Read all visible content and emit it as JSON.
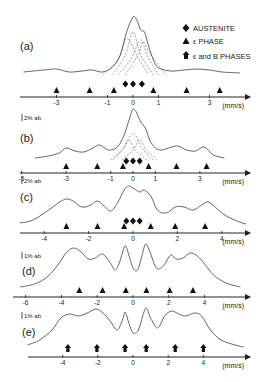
{
  "figure": {
    "legend": {
      "austenite": "AUSTENITE",
      "epsilon": "ε PHASE",
      "epsilon_b": "ε and B PHASES"
    },
    "unit": "(mm/s)"
  },
  "chart_data": [
    {
      "type": "line",
      "panel": "(a)",
      "title": "(a)",
      "xlabel": "(mm/s)",
      "scale_label": "",
      "xticks": [
        -3,
        -1,
        0,
        1,
        3
      ],
      "x0_px": 133,
      "px_per_unit": 25.5,
      "axis_y": 97,
      "axis_x_range": [
        20,
        250
      ],
      "curve": [
        [
          -4.3,
          72
        ],
        [
          -3.5,
          70
        ],
        [
          -3,
          69
        ],
        [
          -2.5,
          72
        ],
        [
          -2,
          71
        ],
        [
          -1.6,
          70
        ],
        [
          -1.2,
          72
        ],
        [
          -0.8,
          67
        ],
        [
          -0.5,
          55
        ],
        [
          -0.25,
          32
        ],
        [
          0,
          17
        ],
        [
          0.15,
          20
        ],
        [
          0.3,
          30
        ],
        [
          0.45,
          32
        ],
        [
          0.6,
          45
        ],
        [
          0.8,
          60
        ],
        [
          1,
          68
        ],
        [
          1.5,
          71
        ],
        [
          2,
          70
        ],
        [
          2.5,
          69
        ],
        [
          3,
          70
        ],
        [
          3.5,
          72
        ],
        [
          4.2,
          73
        ]
      ],
      "subcomponents": [
        [
          [
            -1.2,
            75
          ],
          [
            -0.6,
            60
          ],
          [
            -0.3,
            40
          ],
          [
            -0.1,
            42
          ],
          [
            0.2,
            58
          ],
          [
            0.6,
            74
          ]
        ],
        [
          [
            -0.8,
            75
          ],
          [
            -0.3,
            55
          ],
          [
            0,
            32
          ],
          [
            0.3,
            55
          ],
          [
            0.8,
            75
          ]
        ],
        [
          [
            -0.6,
            75
          ],
          [
            -0.1,
            60
          ],
          [
            0.3,
            40
          ],
          [
            0.55,
            55
          ],
          [
            1,
            75
          ]
        ],
        [
          [
            -0.3,
            75
          ],
          [
            0.2,
            55
          ],
          [
            0.4,
            42
          ],
          [
            0.7,
            55
          ],
          [
            1.3,
            75
          ]
        ]
      ],
      "austenite_markers": [
        -0.3,
        0,
        0.35
      ],
      "epsilon_markers": [
        -3,
        -1.7,
        -0.75,
        0.8,
        2.1,
        3.4
      ],
      "epsilon_b_markers": []
    },
    {
      "type": "line",
      "panel": "(b)",
      "title": "(b)",
      "xlabel": "(mm/s)",
      "scale_label": "2% ab",
      "xticks": [
        -5,
        -3,
        -1,
        0,
        1,
        3
      ],
      "x0_px": 133,
      "px_per_unit": 22.3,
      "axis_y": 173,
      "axis_x_range": [
        20,
        250
      ],
      "curve": [
        [
          -4.4,
          158
        ],
        [
          -3.8,
          156
        ],
        [
          -3.3,
          153
        ],
        [
          -3,
          148
        ],
        [
          -2.6,
          151
        ],
        [
          -2.2,
          152
        ],
        [
          -1.8,
          148
        ],
        [
          -1.5,
          145
        ],
        [
          -1.1,
          150
        ],
        [
          -0.7,
          147
        ],
        [
          -0.4,
          135
        ],
        [
          -0.15,
          118
        ],
        [
          0,
          109
        ],
        [
          0.15,
          112
        ],
        [
          0.35,
          122
        ],
        [
          0.55,
          128
        ],
        [
          0.75,
          140
        ],
        [
          1,
          148
        ],
        [
          1.3,
          150
        ],
        [
          1.6,
          148
        ],
        [
          2,
          146
        ],
        [
          2.4,
          150
        ],
        [
          2.8,
          151
        ],
        [
          3.2,
          147
        ],
        [
          3.6,
          155
        ],
        [
          4.1,
          158
        ]
      ],
      "subcomponents": [
        [
          [
            -0.9,
            160
          ],
          [
            -0.4,
            148
          ],
          [
            0,
            133
          ],
          [
            0.4,
            148
          ],
          [
            0.9,
            160
          ]
        ],
        [
          [
            -1,
            160
          ],
          [
            -0.5,
            150
          ],
          [
            -0.2,
            140
          ],
          [
            0.1,
            150
          ],
          [
            0.6,
            160
          ]
        ],
        [
          [
            -0.5,
            160
          ],
          [
            0,
            150
          ],
          [
            0.3,
            140
          ],
          [
            0.6,
            150
          ],
          [
            1.1,
            160
          ]
        ]
      ],
      "austenite_markers": [
        -0.3,
        0,
        0.3
      ],
      "epsilon_markers": [
        -3,
        -1.6,
        -0.45,
        0.7,
        1.95,
        3.3
      ],
      "epsilon_b_markers": []
    },
    {
      "type": "line",
      "panel": "(c)",
      "title": "(c)",
      "xlabel": "(mm/s)",
      "scale_label": "2% ab",
      "xticks": [
        -4,
        -2,
        0,
        2,
        4
      ],
      "x0_px": 133,
      "px_per_unit": 22.2,
      "axis_y": 233,
      "axis_x_range": [
        20,
        250
      ],
      "curve": [
        [
          -5.1,
          223
        ],
        [
          -4.5,
          220
        ],
        [
          -3.8,
          210
        ],
        [
          -3.3,
          202
        ],
        [
          -3,
          199
        ],
        [
          -2.7,
          201
        ],
        [
          -2.3,
          207
        ],
        [
          -1.9,
          205
        ],
        [
          -1.6,
          201
        ],
        [
          -1.3,
          206
        ],
        [
          -1,
          211
        ],
        [
          -0.7,
          203
        ],
        [
          -0.4,
          190
        ],
        [
          -0.2,
          186
        ],
        [
          0,
          188
        ],
        [
          0.3,
          192
        ],
        [
          0.5,
          190
        ],
        [
          0.8,
          196
        ],
        [
          1.1,
          210
        ],
        [
          1.5,
          213
        ],
        [
          1.9,
          207
        ],
        [
          2.3,
          207
        ],
        [
          2.7,
          210
        ],
        [
          3.1,
          205
        ],
        [
          3.4,
          202
        ],
        [
          3.8,
          209
        ],
        [
          4.2,
          216
        ],
        [
          4.8,
          222
        ],
        [
          5.1,
          224
        ]
      ],
      "subcomponents": [],
      "austenite_markers": [
        -0.3,
        0,
        0.3
      ],
      "epsilon_markers": [
        -3,
        -1.6,
        -0.4,
        0.8,
        1.9,
        3.25
      ],
      "epsilon_b_markers": []
    },
    {
      "type": "line",
      "panel": "(d)",
      "title": "(d)",
      "xlabel": "(mm/s)",
      "scale_label": "1% ab",
      "xticks": [
        -6,
        -4,
        -2,
        0,
        2,
        4
      ],
      "x0_px": 133,
      "px_per_unit": 17.9,
      "axis_y": 297,
      "axis_x_range": [
        13,
        250
      ],
      "curve": [
        [
          -6.3,
          287
        ],
        [
          -5.5,
          284
        ],
        [
          -4.8,
          277
        ],
        [
          -4.2,
          265
        ],
        [
          -3.7,
          252
        ],
        [
          -3.3,
          248
        ],
        [
          -2.9,
          252
        ],
        [
          -2.5,
          259
        ],
        [
          -2.1,
          258
        ],
        [
          -1.7,
          254
        ],
        [
          -1.3,
          262
        ],
        [
          -1,
          270
        ],
        [
          -0.75,
          262
        ],
        [
          -0.45,
          246
        ],
        [
          -0.25,
          254
        ],
        [
          0,
          268
        ],
        [
          0.25,
          270
        ],
        [
          0.5,
          256
        ],
        [
          0.7,
          244
        ],
        [
          0.95,
          252
        ],
        [
          1.3,
          268
        ],
        [
          1.7,
          266
        ],
        [
          2.1,
          255
        ],
        [
          2.4,
          259
        ],
        [
          2.8,
          258
        ],
        [
          3.2,
          253
        ],
        [
          3.6,
          256
        ],
        [
          4,
          264
        ],
        [
          4.5,
          275
        ],
        [
          5.2,
          283
        ],
        [
          6,
          287
        ]
      ],
      "subcomponents": [],
      "austenite_markers": [],
      "epsilon_markers": [
        -3,
        -1.7,
        -0.4,
        0.75,
        2.05,
        3.35
      ],
      "epsilon_b_markers": []
    },
    {
      "type": "line",
      "panel": "(e)",
      "title": "(e)",
      "xlabel": "(mm/s)",
      "scale_label": "1% ab",
      "xticks": [
        -4,
        -2,
        0,
        2,
        4
      ],
      "x0_px": 133,
      "px_per_unit": 17.6,
      "axis_y": 357,
      "axis_x_range": [
        28,
        250
      ],
      "curve": [
        [
          -6,
          345
        ],
        [
          -5.3,
          340
        ],
        [
          -4.6,
          330
        ],
        [
          -4.1,
          318
        ],
        [
          -3.6,
          314
        ],
        [
          -3.1,
          316
        ],
        [
          -2.6,
          313
        ],
        [
          -2.1,
          309
        ],
        [
          -1.7,
          313
        ],
        [
          -1.3,
          321
        ],
        [
          -0.9,
          330
        ],
        [
          -0.6,
          320
        ],
        [
          -0.45,
          312
        ],
        [
          -0.25,
          322
        ],
        [
          0,
          333
        ],
        [
          0.3,
          330
        ],
        [
          0.55,
          316
        ],
        [
          0.75,
          308
        ],
        [
          1,
          318
        ],
        [
          1.4,
          328
        ],
        [
          1.8,
          316
        ],
        [
          2.2,
          311
        ],
        [
          2.6,
          314
        ],
        [
          3,
          316
        ],
        [
          3.5,
          313
        ],
        [
          3.9,
          316
        ],
        [
          4.4,
          330
        ],
        [
          5,
          340
        ],
        [
          5.8,
          345
        ],
        [
          6.3,
          347
        ]
      ],
      "subcomponents": [],
      "austenite_markers": [],
      "epsilon_markers": [],
      "epsilon_b_markers": [
        -3.7,
        -2.05,
        -0.45,
        0.75,
        2.4,
        4
      ]
    }
  ]
}
